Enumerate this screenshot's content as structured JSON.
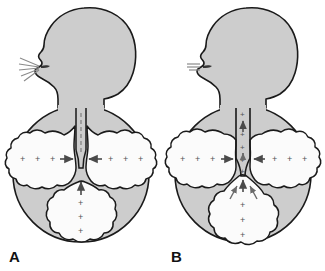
{
  "figure": {
    "background_color": "#ffffff",
    "body_fill_color": "#cdcdcd",
    "organ_fill_color": "#fbfbfb",
    "outline_color": "#1a1a1a",
    "symbol_color": "#555555",
    "panel_count": 2
  },
  "panels": [
    {
      "id": "A",
      "label": "A",
      "condition": "open-airway-forced-expiration",
      "mouth_airflow": {
        "icon": "air-escaping-mouth-icon",
        "state": "air escaping",
        "line_count": 5,
        "pattern": "divergent-rays"
      },
      "trachea": {
        "icon": "trachea-open-icon",
        "state": "open",
        "interior_marks": "dashed-airflow-line",
        "pressure_symbols": ""
      },
      "lung_left": {
        "name": "left-lung",
        "pressure_symbols": "+ + +",
        "arrow": "arrow-right-icon",
        "arrow_direction": "right"
      },
      "lung_right": {
        "name": "right-lung",
        "pressure_symbols": "+ + +",
        "arrow": "arrow-left-icon",
        "arrow_direction": "left"
      },
      "abdomen": {
        "name": "abdominal-cavity",
        "pressure_symbols": "+ + +",
        "arrow": "arrow-up-icon",
        "arrow_direction": "up",
        "arrow_count": 1
      }
    },
    {
      "id": "B",
      "label": "B",
      "condition": "closed-glottis-valsalva-maneuver",
      "mouth_airflow": {
        "icon": "air-blocked-mouth-icon",
        "state": "air blocked",
        "line_count": 3,
        "pattern": "short-parallel-bars"
      },
      "trachea": {
        "icon": "trachea-pressurized-icon",
        "state": "pressurized",
        "interior_marks": "upward-arrows",
        "pressure_symbols": "+ + + + +"
      },
      "lung_left": {
        "name": "left-lung",
        "pressure_symbols": "+ + +",
        "arrow": "arrow-right-icon",
        "arrow_direction": "right"
      },
      "lung_right": {
        "name": "right-lung",
        "pressure_symbols": "+ + +",
        "arrow": "arrow-left-icon",
        "arrow_direction": "left"
      },
      "abdomen": {
        "name": "abdominal-cavity",
        "pressure_symbols": "+ + +",
        "arrow": "converging-arrows-up-icon",
        "arrow_direction": "up-converging",
        "arrow_count": 3
      }
    }
  ]
}
